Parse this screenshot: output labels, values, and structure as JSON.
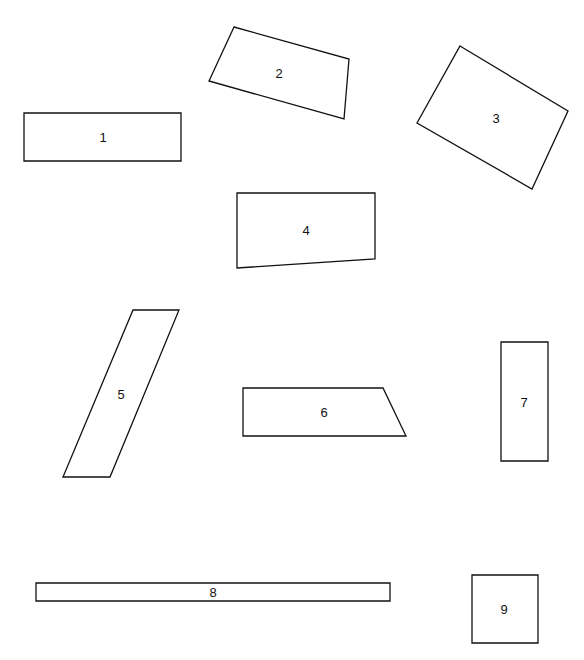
{
  "diagram": {
    "width": 584,
    "height": 660,
    "stroke_color": "#111111",
    "background": "#ffffff",
    "shapes": [
      {
        "id": "1",
        "label": "1",
        "type": "rectangle",
        "points": [
          [
            24,
            113
          ],
          [
            181,
            113
          ],
          [
            181,
            161
          ],
          [
            24,
            161
          ]
        ],
        "label_pos": [
          103,
          137
        ]
      },
      {
        "id": "2",
        "label": "2",
        "type": "quadrilateral",
        "points": [
          [
            234,
            27
          ],
          [
            349,
            59
          ],
          [
            344,
            119
          ],
          [
            209,
            81
          ]
        ],
        "label_pos": [
          279,
          73
        ]
      },
      {
        "id": "3",
        "label": "3",
        "type": "rectangle-rotated",
        "points": [
          [
            460,
            46
          ],
          [
            568,
            111
          ],
          [
            532,
            189
          ],
          [
            417,
            123
          ]
        ],
        "label_pos": [
          496,
          118
        ]
      },
      {
        "id": "4",
        "label": "4",
        "type": "quadrilateral",
        "points": [
          [
            237,
            193
          ],
          [
            375,
            193
          ],
          [
            375,
            259
          ],
          [
            237,
            268
          ]
        ],
        "label_pos": [
          306,
          230
        ]
      },
      {
        "id": "5",
        "label": "5",
        "type": "parallelogram",
        "points": [
          [
            133,
            310
          ],
          [
            179,
            310
          ],
          [
            110,
            477
          ],
          [
            63,
            477
          ]
        ],
        "label_pos": [
          121,
          394
        ]
      },
      {
        "id": "6",
        "label": "6",
        "type": "trapezoid",
        "points": [
          [
            243,
            388
          ],
          [
            383,
            388
          ],
          [
            406,
            436
          ],
          [
            243,
            436
          ]
        ],
        "label_pos": [
          324,
          412
        ]
      },
      {
        "id": "7",
        "label": "7",
        "type": "rectangle",
        "points": [
          [
            501,
            342
          ],
          [
            548,
            342
          ],
          [
            548,
            461
          ],
          [
            501,
            461
          ]
        ],
        "label_pos": [
          524,
          402
        ]
      },
      {
        "id": "8",
        "label": "8",
        "type": "rectangle",
        "points": [
          [
            36,
            583
          ],
          [
            390,
            583
          ],
          [
            390,
            601
          ],
          [
            36,
            601
          ]
        ],
        "label_pos": [
          213,
          592
        ]
      },
      {
        "id": "9",
        "label": "9",
        "type": "rectangle",
        "points": [
          [
            472,
            575
          ],
          [
            538,
            575
          ],
          [
            538,
            643
          ],
          [
            472,
            643
          ]
        ],
        "label_pos": [
          504,
          609
        ]
      }
    ]
  }
}
